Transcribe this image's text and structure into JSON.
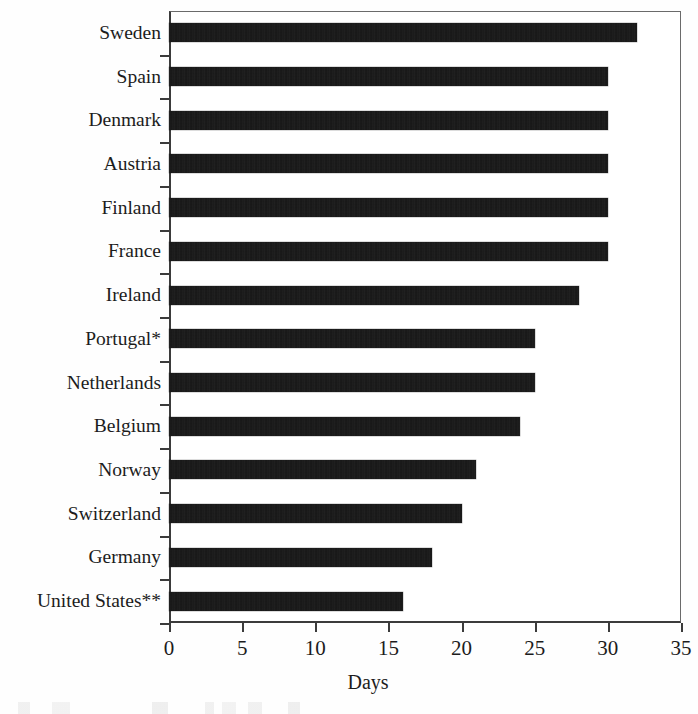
{
  "chart_data": {
    "type": "bar",
    "orientation": "horizontal",
    "title": "",
    "subtitle": "",
    "xlabel": "Days",
    "ylabel": "",
    "categories": [
      "Sweden",
      "Spain",
      "Denmark",
      "Austria",
      "Finland",
      "France",
      "Ireland",
      "Portugal*",
      "Netherlands",
      "Belgium",
      "Norway",
      "Switzerland",
      "Germany",
      "United States**"
    ],
    "values": [
      32,
      30,
      30,
      30,
      30,
      30,
      28,
      25,
      25,
      24,
      21,
      20,
      18,
      16
    ],
    "xlim": [
      0,
      35
    ],
    "xticks": [
      0,
      5,
      10,
      15,
      20,
      25,
      30,
      35
    ],
    "xtick_labels": [
      "0",
      "5",
      "10",
      "15",
      "20",
      "25",
      "30",
      "35"
    ],
    "grid": false,
    "legend": null,
    "bar_color": "#111111",
    "axis_color": "#3b3b3b",
    "background_color": "#ffffff",
    "annotations": [
      "* appended to Portugal label",
      "** appended to United States label"
    ]
  }
}
